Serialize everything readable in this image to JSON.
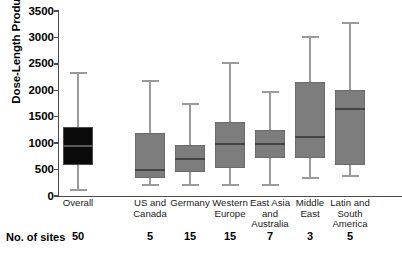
{
  "chart_data": {
    "type": "box",
    "title": "",
    "xlabel": "",
    "ylabel": "Dose-Length Product, mGy x cm",
    "ylim": [
      0,
      3500
    ],
    "yticks": [
      0,
      500,
      1000,
      1500,
      2000,
      2500,
      3000,
      3500
    ],
    "ytick_labels": [
      "0",
      "500",
      "1000",
      "1500",
      "2000",
      "2500",
      "3000",
      "3500"
    ],
    "grid": false,
    "legend": null,
    "categories": [
      "Overall",
      "US and\nCanada",
      "Germany",
      "Western\nEurope",
      "East Asia\nand\nAustralia",
      "Middle\nEast",
      "Latin and\nSouth\nAmerica"
    ],
    "boxes": [
      {
        "category": "Overall",
        "whisker_low": 113,
        "q1": 586,
        "median": 945,
        "q3": 1305,
        "whisker_high": 2325,
        "n": 50,
        "color": "#0a0a0a"
      },
      {
        "category": "US and Canada",
        "whisker_low": 208,
        "q1": 340,
        "median": 490,
        "q3": 1190,
        "whisker_high": 2175,
        "n": 5,
        "color": "#7d7d7d"
      },
      {
        "category": "Germany",
        "whisker_low": 208,
        "q1": 454,
        "median": 700,
        "q3": 965,
        "whisker_high": 1740,
        "n": 15,
        "color": "#7d7d7d"
      },
      {
        "category": "Western Europe",
        "whisker_low": 208,
        "q1": 530,
        "median": 983,
        "q3": 1400,
        "whisker_high": 2515,
        "n": 15,
        "color": "#7d7d7d"
      },
      {
        "category": "East Asia and Australia",
        "whisker_low": 208,
        "q1": 718,
        "median": 983,
        "q3": 1248,
        "whisker_high": 1967,
        "n": 7,
        "color": "#7d7d7d"
      },
      {
        "category": "Middle East",
        "whisker_low": 340,
        "q1": 718,
        "median": 1115,
        "q3": 2155,
        "whisker_high": 3008,
        "n": 3,
        "color": "#7d7d7d"
      },
      {
        "category": "Latin and South America",
        "whisker_low": 378,
        "q1": 586,
        "median": 1645,
        "q3": 2003,
        "whisker_high": 3273,
        "n": 5,
        "color": "#7d7d7d"
      }
    ],
    "n_row_label": "No. of sites",
    "n_values": [
      50,
      5,
      15,
      15,
      7,
      3,
      5
    ]
  },
  "axis": {
    "y_title": "Dose-Length Product, mGy x cm",
    "tick_labels": [
      "3500",
      "3000",
      "2500",
      "2000",
      "1500",
      "1000",
      "500",
      "0"
    ]
  },
  "footer": {
    "sites_label": "No. of sites"
  },
  "colors": {
    "overall_box": "#0a0a0a",
    "region_box": "#7d7d7d",
    "axis": "#4a4a4a",
    "whisker": "#9a9a9a",
    "text": "#000000"
  }
}
